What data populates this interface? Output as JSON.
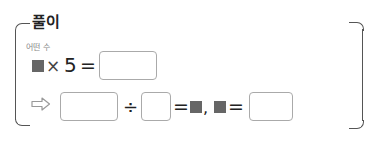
{
  "section": {
    "title": "풀이",
    "hint_label": "어떤 수"
  },
  "line1": {
    "operator_times": "×",
    "number": "5",
    "equals": "="
  },
  "line2": {
    "arrow_icon": "right-arrow-outline",
    "divide": "÷",
    "equals1": "=",
    "comma": ",",
    "equals2": "="
  },
  "colors": {
    "bracket": "#555555",
    "square": "#666666",
    "box_border": "#aaaaaa",
    "hint": "#888888"
  }
}
